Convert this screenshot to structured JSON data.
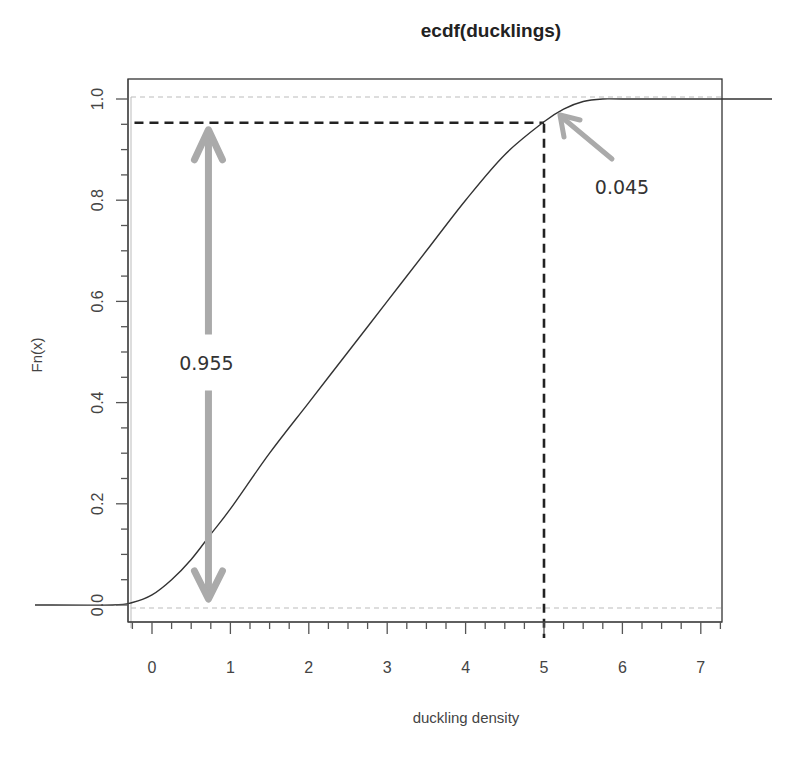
{
  "chart_data": {
    "type": "line",
    "title": "ecdf(ducklings)",
    "xlabel": "duckling density",
    "ylabel": "Fn(x)",
    "xlim": [
      -0.3,
      7.25
    ],
    "ylim": [
      -0.04,
      1.04
    ],
    "x_ticks": [
      0,
      1,
      2,
      3,
      4,
      5,
      6,
      7
    ],
    "x_tick_labels": [
      "0",
      "1",
      "2",
      "3",
      "4",
      "5",
      "6",
      "7"
    ],
    "x_minor_tick_step": 0.25,
    "y_ticks": [
      0.0,
      0.2,
      0.4,
      0.6,
      0.8,
      1.0
    ],
    "y_tick_labels": [
      "0.0",
      "0.2",
      "0.4",
      "0.6",
      "0.8",
      "1.0"
    ],
    "y_minor_tick_step": 0.05,
    "grid": false,
    "legend": null,
    "series": [
      {
        "name": "ecdf(ducklings)",
        "style": "solid",
        "color": "#333333",
        "x": [
          -1.5,
          -0.5,
          -0.25,
          0,
          0.25,
          0.5,
          0.75,
          1.0,
          1.5,
          2.0,
          2.5,
          3.0,
          3.5,
          4.0,
          4.5,
          5.0,
          5.25,
          5.5,
          5.75,
          6.0,
          7.0,
          8.0
        ],
        "y": [
          0.0,
          0.0,
          0.005,
          0.02,
          0.05,
          0.09,
          0.14,
          0.19,
          0.3,
          0.4,
          0.5,
          0.6,
          0.7,
          0.8,
          0.89,
          0.955,
          0.98,
          0.995,
          1.0,
          1.0,
          1.0,
          1.0
        ]
      }
    ],
    "reference_lines": [
      {
        "orientation": "horizontal",
        "y": 1.0,
        "style": "dashed",
        "color": "#bbbbbb"
      },
      {
        "orientation": "horizontal",
        "y": 0.0,
        "style": "dashed",
        "color": "#bbbbbb"
      },
      {
        "orientation": "horizontal",
        "y": 0.955,
        "x_range": [
          -0.3,
          5.0
        ],
        "style": "dashed",
        "color": "#222222"
      },
      {
        "orientation": "vertical",
        "x": 5.0,
        "y_range": [
          -0.04,
          0.955
        ],
        "style": "dashed",
        "color": "#222222"
      }
    ],
    "annotations": [
      {
        "text": "0.955",
        "type": "double-arrow",
        "x": 0.72,
        "y_from": 0.0,
        "y_to": 0.955,
        "color": "#aaaaaa"
      },
      {
        "text": "0.045",
        "type": "arrow",
        "from": [
          5.85,
          0.86
        ],
        "to": [
          5.2,
          0.97
        ],
        "color": "#aaaaaa"
      }
    ]
  }
}
